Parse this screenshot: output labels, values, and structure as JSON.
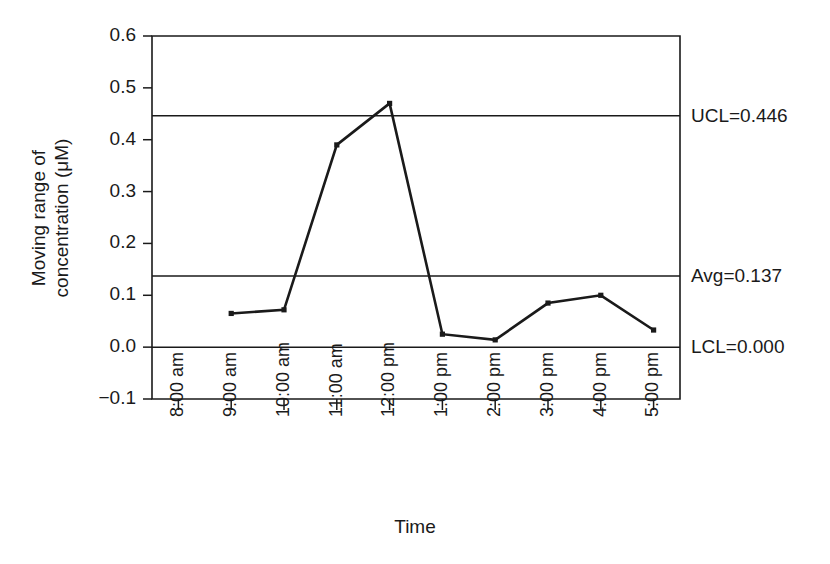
{
  "chart_data": {
    "type": "line",
    "title": "",
    "xlabel": "Time",
    "ylabel_line1": "Moving range of",
    "ylabel_line2": "concentration (μM)",
    "categories": [
      "8:00 am",
      "9:00 am",
      "10:00 am",
      "11:00 am",
      "12:00 pm",
      "1:00 pm",
      "2:00 pm",
      "3:00 pm",
      "4:00 pm",
      "5:00 pm"
    ],
    "values": [
      null,
      0.065,
      0.072,
      0.39,
      0.47,
      0.025,
      0.014,
      0.085,
      0.1,
      0.033
    ],
    "ylim": [
      -0.1,
      0.6
    ],
    "yticks": [
      -0.1,
      0.0,
      0.1,
      0.2,
      0.3,
      0.4,
      0.5,
      0.6
    ],
    "ytick_labels": [
      "−0.1",
      "0.0",
      "0.1",
      "0.2",
      "0.3",
      "0.4",
      "0.5",
      "0.6"
    ],
    "grid": false,
    "legend": "none",
    "series_color": "#1a1a1a",
    "control_limits": [
      {
        "name": "UCL",
        "label": "UCL=0.446",
        "value": 0.446
      },
      {
        "name": "Avg",
        "label": "Avg=0.137",
        "value": 0.137
      },
      {
        "name": "LCL",
        "label": "LCL=0.000",
        "value": 0.0
      }
    ]
  }
}
